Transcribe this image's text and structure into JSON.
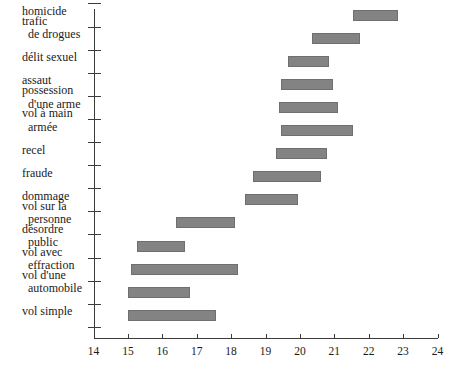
{
  "chart_data": {
    "type": "bar",
    "orientation": "horizontal",
    "subtype": "range-bar",
    "title": "",
    "subtitle": "",
    "xlabel": "",
    "ylabel": "",
    "xlim": [
      14,
      24
    ],
    "ylim": null,
    "grid": false,
    "legend": null,
    "xticks": [
      "14",
      "15",
      "16",
      "17",
      "18",
      "19",
      "20",
      "21",
      "22",
      "23",
      "24"
    ],
    "xtick_values": [
      14,
      15,
      16,
      17,
      18,
      19,
      20,
      21,
      22,
      23,
      24
    ],
    "categories": [
      "homicide",
      "trafic\n  de drogues",
      "délit sexuel",
      "assaut",
      "possession\n  d'une arme",
      "vol à main\n  armée",
      "recel",
      "fraude",
      "dommage",
      "vol sur la\n  personne",
      "désordre\n  public",
      "vol avec\n  effraction",
      "vol d'une\n  automobile",
      "vol simple"
    ],
    "series": [
      {
        "name": "intervalle",
        "ranges": [
          {
            "category": "homicide",
            "start": 21.55,
            "end": 22.85
          },
          {
            "category": "trafic de drogues",
            "start": 20.35,
            "end": 21.75
          },
          {
            "category": "délit sexuel",
            "start": 19.65,
            "end": 20.85
          },
          {
            "category": "assaut",
            "start": 19.45,
            "end": 20.95
          },
          {
            "category": "possession d'une arme",
            "start": 19.4,
            "end": 21.1
          },
          {
            "category": "vol à main armée",
            "start": 19.45,
            "end": 21.55
          },
          {
            "category": "recel",
            "start": 19.3,
            "end": 20.8
          },
          {
            "category": "fraude",
            "start": 18.65,
            "end": 20.6
          },
          {
            "category": "dommage",
            "start": 18.4,
            "end": 19.95
          },
          {
            "category": "vol sur la personne",
            "start": 16.4,
            "end": 18.1
          },
          {
            "category": "désordre public",
            "start": 15.25,
            "end": 16.65
          },
          {
            "category": "vol avec effraction",
            "start": 15.1,
            "end": 18.2
          },
          {
            "category": "vol d'une automobile",
            "start": 15.0,
            "end": 16.8
          },
          {
            "category": "vol simple",
            "start": 15.0,
            "end": 17.55
          }
        ]
      }
    ],
    "colors": {
      "bar_fill": "#838383",
      "bar_edge": "#6f6f6f",
      "axis": "#3b3b3b",
      "text": "#1a1a1a",
      "background": "#ffffff"
    }
  }
}
